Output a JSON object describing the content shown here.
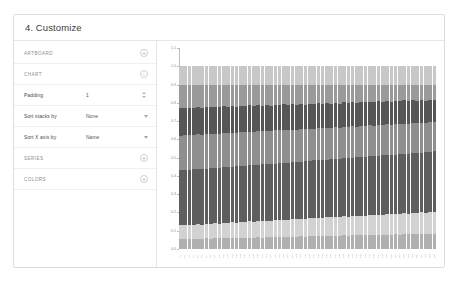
{
  "card": {
    "title": "4. Customize"
  },
  "panel": {
    "rows": [
      {
        "kind": "section",
        "label": "ARTBOARD",
        "control": "plus-button",
        "control_glyph": "+"
      },
      {
        "kind": "section",
        "label": "CHART",
        "control": "minus-button",
        "control_glyph": "−"
      },
      {
        "kind": "field",
        "label": "Padding",
        "value": "1",
        "control": "stepper"
      },
      {
        "kind": "field",
        "label": "Sort stacks by",
        "value": "None",
        "control": "dropdown"
      },
      {
        "kind": "field",
        "label": "Sort X axis by",
        "value": "Name",
        "control": "dropdown"
      },
      {
        "kind": "section",
        "label": "SERIES",
        "control": "plus-button",
        "control_glyph": "+"
      },
      {
        "kind": "section",
        "label": "COLORS",
        "control": "plus-button",
        "control_glyph": "+"
      }
    ]
  },
  "chart_data": {
    "type": "bar",
    "stacked": true,
    "normalized": true,
    "title": "",
    "xlabel": "",
    "ylabel": "",
    "ylim": [
      0.0,
      1.1
    ],
    "grid": false,
    "legend": "none",
    "yticks": [
      "1.1",
      "1.0",
      "0.9",
      "0.8",
      "0.7",
      "0.6",
      "0.5",
      "0.4",
      "0.3",
      "0.2",
      "0.1",
      "0.0"
    ],
    "categories": [
      "C1",
      "C2",
      "C3",
      "C4",
      "C5",
      "C6",
      "C7",
      "C8",
      "C9",
      "C10",
      "C11",
      "C12",
      "C13",
      "C14",
      "C15",
      "C16",
      "C17",
      "C18",
      "C19",
      "C20",
      "C21",
      "C22",
      "C23",
      "C24",
      "C25",
      "C26",
      "C27",
      "C28",
      "C29",
      "C30",
      "C31",
      "C32",
      "C33",
      "C34",
      "C35",
      "C36",
      "C37",
      "C38",
      "C39",
      "C40",
      "C41",
      "C42",
      "C43",
      "C44",
      "C45",
      "C46",
      "C47",
      "C48",
      "C49",
      "C50",
      "C51",
      "C52",
      "C53",
      "C54",
      "C55",
      "C56",
      "C57",
      "C58",
      "C59",
      "C60"
    ],
    "series": [
      {
        "name": "Series 1",
        "color": "#b0b0b0",
        "values": [
          0.055,
          0.054,
          0.056,
          0.055,
          0.057,
          0.056,
          0.058,
          0.057,
          0.059,
          0.058,
          0.06,
          0.059,
          0.061,
          0.06,
          0.062,
          0.061,
          0.063,
          0.062,
          0.064,
          0.063,
          0.065,
          0.064,
          0.066,
          0.065,
          0.067,
          0.066,
          0.068,
          0.067,
          0.069,
          0.068,
          0.07,
          0.069,
          0.071,
          0.07,
          0.072,
          0.071,
          0.073,
          0.072,
          0.074,
          0.073,
          0.075,
          0.074,
          0.076,
          0.075,
          0.077,
          0.076,
          0.078,
          0.077,
          0.079,
          0.078,
          0.08,
          0.079,
          0.081,
          0.08,
          0.082,
          0.081,
          0.083,
          0.082,
          0.084,
          0.083
        ]
      },
      {
        "name": "Series 2",
        "color": "#d2d2d2",
        "values": [
          0.075,
          0.077,
          0.076,
          0.078,
          0.079,
          0.078,
          0.08,
          0.081,
          0.082,
          0.081,
          0.083,
          0.084,
          0.085,
          0.084,
          0.086,
          0.087,
          0.088,
          0.087,
          0.089,
          0.09,
          0.091,
          0.09,
          0.092,
          0.093,
          0.094,
          0.093,
          0.095,
          0.096,
          0.097,
          0.096,
          0.098,
          0.099,
          0.1,
          0.099,
          0.101,
          0.102,
          0.103,
          0.102,
          0.104,
          0.105,
          0.106,
          0.105,
          0.107,
          0.108,
          0.109,
          0.108,
          0.11,
          0.111,
          0.112,
          0.111,
          0.113,
          0.114,
          0.115,
          0.114,
          0.116,
          0.117,
          0.118,
          0.117,
          0.119,
          0.12
        ]
      },
      {
        "name": "Series 3",
        "color": "#5e5e5e",
        "values": [
          0.3,
          0.302,
          0.299,
          0.303,
          0.301,
          0.304,
          0.302,
          0.305,
          0.303,
          0.306,
          0.304,
          0.307,
          0.305,
          0.308,
          0.306,
          0.309,
          0.307,
          0.31,
          0.308,
          0.311,
          0.309,
          0.312,
          0.31,
          0.313,
          0.311,
          0.314,
          0.312,
          0.315,
          0.313,
          0.316,
          0.314,
          0.317,
          0.315,
          0.318,
          0.316,
          0.319,
          0.317,
          0.32,
          0.318,
          0.321,
          0.319,
          0.322,
          0.32,
          0.323,
          0.321,
          0.324,
          0.322,
          0.325,
          0.323,
          0.326,
          0.324,
          0.327,
          0.325,
          0.328,
          0.326,
          0.329,
          0.327,
          0.33,
          0.328,
          0.331
        ]
      },
      {
        "name": "Series 4",
        "color": "#8f8f8f",
        "values": [
          0.19,
          0.189,
          0.191,
          0.188,
          0.19,
          0.187,
          0.189,
          0.186,
          0.188,
          0.185,
          0.187,
          0.184,
          0.186,
          0.183,
          0.185,
          0.182,
          0.184,
          0.181,
          0.183,
          0.18,
          0.182,
          0.179,
          0.181,
          0.178,
          0.18,
          0.177,
          0.179,
          0.176,
          0.178,
          0.175,
          0.177,
          0.174,
          0.176,
          0.173,
          0.175,
          0.172,
          0.174,
          0.171,
          0.173,
          0.17,
          0.172,
          0.169,
          0.171,
          0.168,
          0.17,
          0.167,
          0.169,
          0.166,
          0.168,
          0.165,
          0.167,
          0.164,
          0.166,
          0.163,
          0.165,
          0.162,
          0.164,
          0.161,
          0.163,
          0.16
        ]
      },
      {
        "name": "Series 5",
        "color": "#565656",
        "values": [
          0.15,
          0.149,
          0.151,
          0.148,
          0.15,
          0.147,
          0.149,
          0.146,
          0.148,
          0.145,
          0.147,
          0.144,
          0.146,
          0.143,
          0.145,
          0.142,
          0.144,
          0.141,
          0.143,
          0.14,
          0.142,
          0.139,
          0.141,
          0.138,
          0.14,
          0.137,
          0.139,
          0.136,
          0.138,
          0.135,
          0.137,
          0.134,
          0.136,
          0.133,
          0.135,
          0.132,
          0.134,
          0.131,
          0.133,
          0.13,
          0.132,
          0.129,
          0.131,
          0.128,
          0.13,
          0.127,
          0.129,
          0.126,
          0.128,
          0.125,
          0.127,
          0.124,
          0.126,
          0.123,
          0.125,
          0.122,
          0.124,
          0.121,
          0.123,
          0.12
        ]
      },
      {
        "name": "Series 6",
        "color": "#9a9a9a",
        "values": [
          0.13,
          0.129,
          0.127,
          0.128,
          0.123,
          0.128,
          0.122,
          0.125,
          0.12,
          0.125,
          0.119,
          0.122,
          0.117,
          0.122,
          0.116,
          0.119,
          0.114,
          0.119,
          0.113,
          0.116,
          0.111,
          0.116,
          0.11,
          0.113,
          0.108,
          0.113,
          0.107,
          0.11,
          0.105,
          0.11,
          0.104,
          0.107,
          0.102,
          0.107,
          0.101,
          0.104,
          0.099,
          0.104,
          0.098,
          0.101,
          0.096,
          0.101,
          0.095,
          0.098,
          0.093,
          0.098,
          0.092,
          0.095,
          0.09,
          0.095,
          0.089,
          0.092,
          0.087,
          0.092,
          0.086,
          0.089,
          0.084,
          0.089,
          0.083,
          0.086
        ]
      },
      {
        "name": "Series 7",
        "color": "#c8c8c8",
        "values": [
          0.1,
          0.1,
          0.1,
          0.1,
          0.1,
          0.1,
          0.1,
          0.1,
          0.1,
          0.102,
          0.1,
          0.1,
          0.1,
          0.1,
          0.1,
          0.1,
          0.1,
          0.1,
          0.1,
          0.1,
          0.1,
          0.1,
          0.1,
          0.1,
          0.1,
          0.1,
          0.1,
          0.1,
          0.1,
          0.1,
          0.101,
          0.1,
          0.101,
          0.1,
          0.101,
          0.1,
          0.101,
          0.1,
          0.101,
          0.1,
          0.1,
          0.1,
          0.1,
          0.1,
          0.1,
          0.1,
          0.1,
          0.1,
          0.1,
          0.101,
          0.1,
          0.1,
          0.1,
          0.1,
          0.1,
          0.1,
          0.1,
          0.1,
          0.1,
          0.1
        ]
      }
    ]
  }
}
